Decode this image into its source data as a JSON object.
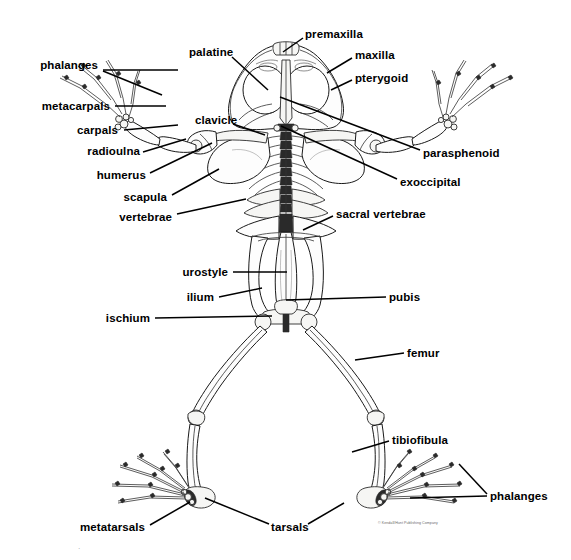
{
  "figure": {
    "width": 571,
    "height": 560,
    "background_color": "#ffffff",
    "ink_color": "#000000",
    "leader_line_color": "#000000",
    "credit_text": "© Kendall/Hunt Publishing Company",
    "credit_color": "#6a6a6a"
  },
  "labels": [
    {
      "id": "phalanges-forelimb",
      "text": "phalanges",
      "text_x": 98,
      "text_y": 65,
      "align": "end",
      "leaders": [
        {
          "x1": 103,
          "y1": 70,
          "x2": 178,
          "y2": 70
        },
        {
          "x1": 103,
          "y1": 71,
          "x2": 162,
          "y2": 95
        }
      ]
    },
    {
      "id": "metacarpals",
      "text": "metacarpals",
      "text_x": 110,
      "text_y": 106,
      "align": "end",
      "leaders": [
        {
          "x1": 115,
          "y1": 106,
          "x2": 166,
          "y2": 106
        }
      ]
    },
    {
      "id": "carpals",
      "text": "carpals",
      "text_x": 118,
      "text_y": 130,
      "align": "end",
      "leaders": [
        {
          "x1": 124,
          "y1": 130,
          "x2": 178,
          "y2": 125
        }
      ]
    },
    {
      "id": "radioulna",
      "text": "radioulna",
      "text_x": 140,
      "text_y": 151,
      "align": "end",
      "leaders": [
        {
          "x1": 143,
          "y1": 152,
          "x2": 186,
          "y2": 139
        }
      ]
    },
    {
      "id": "humerus",
      "text": "humerus",
      "text_x": 146,
      "text_y": 175,
      "align": "end",
      "leaders": [
        {
          "x1": 150,
          "y1": 173,
          "x2": 212,
          "y2": 143
        }
      ]
    },
    {
      "id": "scapula",
      "text": "scapula",
      "text_x": 167,
      "text_y": 197,
      "align": "end",
      "leaders": [
        {
          "x1": 172,
          "y1": 195,
          "x2": 219,
          "y2": 169
        }
      ]
    },
    {
      "id": "vertebrae",
      "text": "vertebrae",
      "text_x": 172,
      "text_y": 217,
      "align": "end",
      "leaders": [
        {
          "x1": 177,
          "y1": 214,
          "x2": 246,
          "y2": 199
        }
      ]
    },
    {
      "id": "clavicle",
      "text": "clavicle",
      "text_x": 195,
      "text_y": 120,
      "align": "start",
      "leaders": [
        {
          "x1": 233,
          "y1": 124,
          "x2": 265,
          "y2": 135
        }
      ]
    },
    {
      "id": "palatine",
      "text": "palatine",
      "text_x": 189,
      "text_y": 52,
      "align": "start",
      "leaders": [
        {
          "x1": 232,
          "y1": 57,
          "x2": 268,
          "y2": 90
        }
      ]
    },
    {
      "id": "premaxilla",
      "text": "premaxilla",
      "text_x": 305,
      "text_y": 34,
      "align": "start",
      "leaders": [
        {
          "x1": 303,
          "y1": 38,
          "x2": 283,
          "y2": 52
        }
      ]
    },
    {
      "id": "maxilla",
      "text": "maxilla",
      "text_x": 355,
      "text_y": 55,
      "align": "start",
      "leaders": [
        {
          "x1": 352,
          "y1": 58,
          "x2": 327,
          "y2": 73
        }
      ]
    },
    {
      "id": "pterygoid",
      "text": "pterygoid",
      "text_x": 355,
      "text_y": 78,
      "align": "start",
      "leaders": [
        {
          "x1": 352,
          "y1": 80,
          "x2": 331,
          "y2": 90
        }
      ]
    },
    {
      "id": "parasphenoid",
      "text": "parasphenoid",
      "text_x": 423,
      "text_y": 153,
      "align": "start",
      "leaders": [
        {
          "x1": 420,
          "y1": 150,
          "x2": 280,
          "y2": 97
        }
      ]
    },
    {
      "id": "exoccipital",
      "text": "exoccipital",
      "text_x": 400,
      "text_y": 182,
      "align": "start",
      "leaders": [
        {
          "x1": 397,
          "y1": 179,
          "x2": 281,
          "y2": 126
        }
      ]
    },
    {
      "id": "sacral-vertebrae",
      "text": "sacral vertebrae",
      "text_x": 336,
      "text_y": 214,
      "align": "start",
      "leaders": [
        {
          "x1": 333,
          "y1": 216,
          "x2": 303,
          "y2": 230
        }
      ]
    },
    {
      "id": "urostyle",
      "text": "urostyle",
      "text_x": 228,
      "text_y": 272,
      "align": "end",
      "leaders": [
        {
          "x1": 233,
          "y1": 272,
          "x2": 287,
          "y2": 272
        }
      ]
    },
    {
      "id": "ilium",
      "text": "ilium",
      "text_x": 214,
      "text_y": 297,
      "align": "end",
      "leaders": [
        {
          "x1": 219,
          "y1": 297,
          "x2": 262,
          "y2": 288
        }
      ]
    },
    {
      "id": "ischium",
      "text": "ischium",
      "text_x": 150,
      "text_y": 318,
      "align": "end",
      "leaders": [
        {
          "x1": 155,
          "y1": 318,
          "x2": 272,
          "y2": 316
        }
      ]
    },
    {
      "id": "pubis",
      "text": "pubis",
      "text_x": 389,
      "text_y": 297,
      "align": "start",
      "leaders": [
        {
          "x1": 386,
          "y1": 297,
          "x2": 286,
          "y2": 300
        }
      ]
    },
    {
      "id": "femur",
      "text": "femur",
      "text_x": 407,
      "text_y": 353,
      "align": "start",
      "leaders": [
        {
          "x1": 404,
          "y1": 353,
          "x2": 355,
          "y2": 360
        }
      ]
    },
    {
      "id": "tibiofibula",
      "text": "tibiofibula",
      "text_x": 392,
      "text_y": 440,
      "align": "start",
      "leaders": [
        {
          "x1": 389,
          "y1": 441,
          "x2": 352,
          "y2": 452
        }
      ]
    },
    {
      "id": "phalanges-hindlimb",
      "text": "phalanges",
      "text_x": 490,
      "text_y": 496,
      "align": "start",
      "leaders": [
        {
          "x1": 487,
          "y1": 494,
          "x2": 459,
          "y2": 464
        },
        {
          "x1": 487,
          "y1": 496,
          "x2": 410,
          "y2": 498
        }
      ]
    },
    {
      "id": "metatarsals",
      "text": "metatarsals",
      "text_x": 145,
      "text_y": 527,
      "align": "end",
      "leaders": [
        {
          "x1": 150,
          "y1": 525,
          "x2": 190,
          "y2": 502
        }
      ]
    },
    {
      "id": "tarsals",
      "text": "tarsals",
      "text_x": 271,
      "text_y": 527,
      "align": "start",
      "leaders": [
        {
          "x1": 269,
          "y1": 524,
          "x2": 205,
          "y2": 498
        },
        {
          "x1": 308,
          "y1": 524,
          "x2": 344,
          "y2": 503
        }
      ]
    }
  ],
  "credit": {
    "text": "© Kendall/Hunt Publishing Company",
    "x": 378,
    "y": 521
  }
}
